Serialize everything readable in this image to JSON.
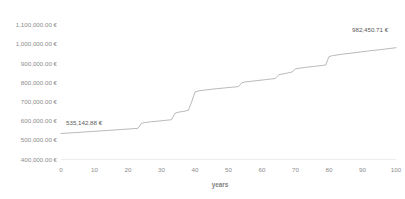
{
  "chart_data": {
    "type": "line",
    "title": "",
    "subtitle": "",
    "xlabel": "years",
    "ylabel": "",
    "xlim": [
      0,
      100
    ],
    "ylim": [
      400000,
      1100000
    ],
    "grid": false,
    "legend": false,
    "legend_position": "none",
    "currency_symbol": "€",
    "x_tick_labels": [
      "0",
      "10",
      "20",
      "30",
      "40",
      "50",
      "60",
      "70",
      "80",
      "90",
      "100"
    ],
    "x_tick_values": [
      0,
      10,
      20,
      30,
      40,
      50,
      60,
      70,
      80,
      90,
      100
    ],
    "y_tick_labels": [
      "400,000.00 €",
      "500,000.00 €",
      "600,000.00 €",
      "700,000.00 €",
      "800,000.00 €",
      "900,000.00 €",
      "1,000,000.00 €",
      "1,100,000.00 €"
    ],
    "y_tick_values": [
      400000,
      500000,
      600000,
      700000,
      800000,
      900000,
      1000000,
      1100000
    ],
    "annotations": [
      {
        "name": "start-value-label",
        "text": "535,142.88 €",
        "x": 2,
        "y": 535142.88
      },
      {
        "name": "end-value-label",
        "text": "982,450.71 €",
        "x": 100,
        "y": 982450.71
      }
    ],
    "series": [
      {
        "name": "value",
        "color": "#9c9c9c",
        "x": [
          0,
          3,
          6,
          9,
          12,
          15,
          18,
          21,
          23,
          24,
          25,
          27,
          30,
          32,
          33,
          34,
          35,
          37,
          38,
          39,
          40,
          41,
          43,
          46,
          49,
          52,
          53,
          54,
          55,
          58,
          61,
          63,
          64,
          65,
          67,
          68,
          69,
          70,
          72,
          73,
          74,
          75,
          78,
          79,
          80,
          81,
          84,
          88,
          92,
          96,
          100
        ],
        "values": [
          535142.88,
          538500,
          541800,
          545200,
          548700,
          552300,
          556000,
          559600,
          562200,
          588000,
          592000,
          596500,
          601500,
          605200,
          607000,
          640000,
          646000,
          652000,
          656000,
          700000,
          752000,
          757000,
          762000,
          768000,
          773000,
          778000,
          780000,
          800000,
          804000,
          810000,
          816000,
          820000,
          822000,
          842000,
          848000,
          852000,
          856000,
          872000,
          878000,
          880000,
          882000,
          884000,
          890000,
          892000,
          936000,
          941000,
          949000,
          957000,
          966000,
          974000,
          982450.71
        ]
      }
    ]
  }
}
